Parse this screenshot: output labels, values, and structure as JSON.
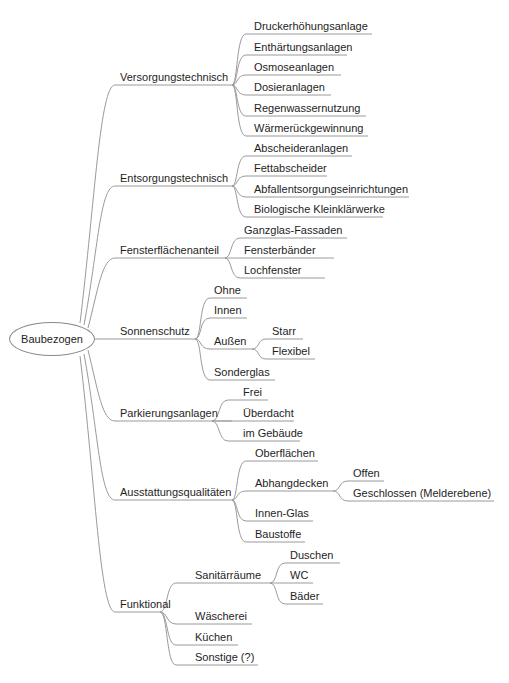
{
  "root": {
    "label": "Baubezogen"
  },
  "branches": [
    {
      "label": "Versorgungstechnisch",
      "children": [
        {
          "label": "Druckerhöhungsanlage"
        },
        {
          "label": "Enthärtungsanlagen"
        },
        {
          "label": "Osmoseanlagen"
        },
        {
          "label": "Dosieranlagen"
        },
        {
          "label": "Regenwassernutzung"
        },
        {
          "label": "Wärmerückgewinnung"
        }
      ]
    },
    {
      "label": "Entsorgungstechnisch",
      "children": [
        {
          "label": "Abscheideranlagen"
        },
        {
          "label": "Fettabscheider"
        },
        {
          "label": "Abfallentsorgungseinrichtungen"
        },
        {
          "label": "Biologische Kleinklärwerke"
        }
      ]
    },
    {
      "label": "Fensterflächenanteil",
      "children": [
        {
          "label": "Ganzglas-Fassaden"
        },
        {
          "label": "Fensterbänder"
        },
        {
          "label": "Lochfenster"
        }
      ]
    },
    {
      "label": "Sonnenschutz",
      "children": [
        {
          "label": "Ohne"
        },
        {
          "label": "Innen"
        },
        {
          "label": "Außen",
          "children": [
            {
              "label": "Starr"
            },
            {
              "label": "Flexibel"
            }
          ]
        },
        {
          "label": "Sonderglas"
        }
      ]
    },
    {
      "label": "Parkierungsanlagen",
      "children": [
        {
          "label": "Frei"
        },
        {
          "label": "Überdacht"
        },
        {
          "label": "im Gebäude"
        }
      ]
    },
    {
      "label": "Ausstattungsqualitäten",
      "children": [
        {
          "label": "Oberflächen"
        },
        {
          "label": "Abhangdecken",
          "children": [
            {
              "label": "Offen"
            },
            {
              "label": "Geschlossen (Melderebene)"
            }
          ]
        },
        {
          "label": "Innen-Glas"
        },
        {
          "label": "Baustoffe"
        }
      ]
    },
    {
      "label": "Funktional",
      "children": [
        {
          "label": "Sanitärräume",
          "children": [
            {
              "label": "Duschen"
            },
            {
              "label": "WC"
            },
            {
              "label": "Bäder"
            }
          ]
        },
        {
          "label": "Wäscherei"
        },
        {
          "label": "Küchen"
        },
        {
          "label": "Sonstige (?)"
        }
      ]
    }
  ],
  "colors": {
    "edge": "#9a9a9a",
    "text": "#1e1e1e",
    "background": "#ffffff"
  }
}
